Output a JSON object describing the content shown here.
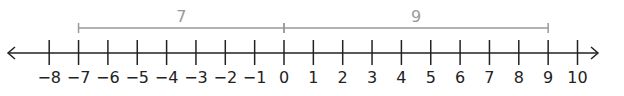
{
  "chart_data": {
    "type": "number_line",
    "range": [
      -8,
      10
    ],
    "ticks": [
      -8,
      -7,
      -6,
      -5,
      -4,
      -3,
      -2,
      -1,
      0,
      1,
      2,
      3,
      4,
      5,
      6,
      7,
      8,
      9,
      10
    ],
    "tick_labels": [
      "−8",
      "−7",
      "−6",
      "−5",
      "−4",
      "−3",
      "−2",
      "−1",
      "0",
      "1",
      "2",
      "3",
      "4",
      "5",
      "6",
      "7",
      "8",
      "9",
      "10"
    ],
    "arrows": [
      "left",
      "right"
    ],
    "brackets": [
      {
        "from": -7,
        "to": 0,
        "label": "7"
      },
      {
        "from": 0,
        "to": 9,
        "label": "9"
      }
    ]
  },
  "colors": {
    "axis": "#222222",
    "bracket": "#999999",
    "label": "#222222"
  },
  "layout": {
    "x0": 284,
    "unit": 29.35,
    "axis_y": 53,
    "tick_top": 40,
    "tick_bottom": 65,
    "label_y": 83,
    "bracket_y": 28,
    "bracket_label_y": 22,
    "arrow_left_x": 8,
    "arrow_right_x": 598
  }
}
